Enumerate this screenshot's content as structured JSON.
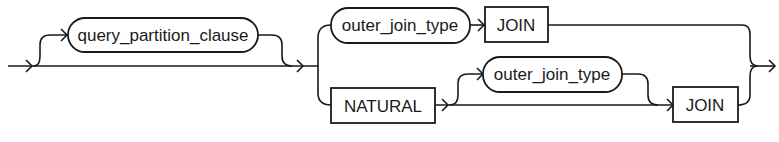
{
  "diagram": {
    "type": "railroad-syntax-diagram",
    "nodes": {
      "query_partition_clause": {
        "label": "query_partition_clause",
        "kind": "non-terminal"
      },
      "outer_join_type_top": {
        "label": "outer_join_type",
        "kind": "non-terminal"
      },
      "join_top": {
        "label": "JOIN",
        "kind": "keyword"
      },
      "natural": {
        "label": "NATURAL",
        "kind": "keyword"
      },
      "outer_join_type_bottom": {
        "label": "outer_join_type",
        "kind": "non-terminal"
      },
      "join_bottom": {
        "label": "JOIN",
        "kind": "keyword"
      }
    },
    "paths": [
      [
        "start",
        "query_partition_clause (optional)",
        "branch"
      ],
      [
        "branch",
        "outer_join_type",
        "JOIN",
        "end"
      ],
      [
        "branch",
        "NATURAL",
        "outer_join_type (optional)",
        "JOIN",
        "end"
      ]
    ],
    "colors": {
      "stroke": "#1a1a1a",
      "background": "#ffffff"
    }
  }
}
